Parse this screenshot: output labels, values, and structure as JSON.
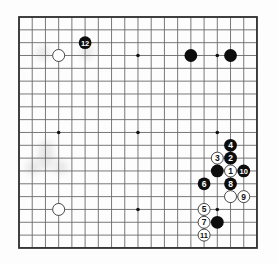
{
  "board": {
    "size": 19,
    "origin_px": [
      19,
      17
    ],
    "spacing_px": [
      13.22,
      12.83
    ],
    "line_color": "#6a6a6a",
    "border_color": "#333333",
    "star_points": [
      [
        3,
        3
      ],
      [
        9,
        3
      ],
      [
        15,
        3
      ],
      [
        3,
        9
      ],
      [
        9,
        9
      ],
      [
        15,
        9
      ],
      [
        3,
        15
      ],
      [
        9,
        15
      ],
      [
        15,
        15
      ]
    ]
  },
  "stones": [
    {
      "color": "black",
      "col": 5,
      "row": 2,
      "label": "12"
    },
    {
      "color": "white",
      "col": 3,
      "row": 3,
      "label": ""
    },
    {
      "color": "black",
      "col": 13,
      "row": 3,
      "label": ""
    },
    {
      "color": "black",
      "col": 16,
      "row": 3,
      "label": ""
    },
    {
      "color": "black",
      "col": 16,
      "row": 10,
      "label": "4"
    },
    {
      "color": "white",
      "col": 15,
      "row": 11,
      "label": "3"
    },
    {
      "color": "black",
      "col": 16,
      "row": 11,
      "label": "2"
    },
    {
      "color": "black",
      "col": 15,
      "row": 12,
      "label": ""
    },
    {
      "color": "white",
      "col": 16,
      "row": 12,
      "label": "1"
    },
    {
      "color": "black",
      "col": 17,
      "row": 12,
      "label": "10"
    },
    {
      "color": "black",
      "col": 14,
      "row": 13,
      "label": "6"
    },
    {
      "color": "black",
      "col": 16,
      "row": 13,
      "label": "8"
    },
    {
      "color": "white",
      "col": 16,
      "row": 14,
      "label": ""
    },
    {
      "color": "white",
      "col": 17,
      "row": 14,
      "label": "9"
    },
    {
      "color": "white",
      "col": 3,
      "row": 15,
      "label": ""
    },
    {
      "color": "white",
      "col": 14,
      "row": 15,
      "label": "5"
    },
    {
      "color": "white",
      "col": 14,
      "row": 16,
      "label": "7"
    },
    {
      "color": "black",
      "col": 15,
      "row": 16,
      "label": ""
    },
    {
      "color": "white",
      "col": 14,
      "row": 17,
      "label": "11"
    }
  ]
}
